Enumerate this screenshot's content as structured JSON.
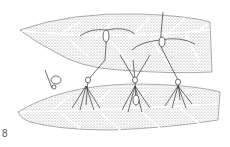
{
  "figure": {
    "label": "8",
    "colors": {
      "ink": "#333333",
      "stipple": "#9a9a9a",
      "background": "#ffffff"
    }
  }
}
